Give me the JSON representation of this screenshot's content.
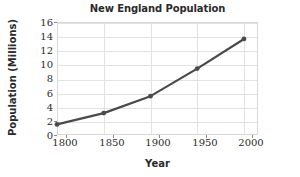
{
  "chart_data": {
    "type": "line",
    "title": "New England Population",
    "xlabel": "Year",
    "ylabel": "Population (Millions)",
    "x": [
      1790,
      1840,
      1890,
      1940,
      1990
    ],
    "values": [
      1.5,
      3.1,
      5.5,
      9.4,
      13.6
    ],
    "series": [
      {
        "name": "New England Population",
        "values": [
          1.5,
          3.1,
          5.5,
          9.4,
          13.6
        ]
      }
    ],
    "xlim": [
      1790,
      2005
    ],
    "ylim": [
      0,
      16
    ],
    "xticks": [
      1800,
      1850,
      1900,
      1950,
      2000
    ],
    "yticks": [
      0,
      2,
      4,
      6,
      8,
      10,
      12,
      14,
      16
    ],
    "xtick_labels": [
      "1800",
      "1850",
      "1900",
      "1950",
      "2000"
    ],
    "ytick_labels": [
      "0",
      "2",
      "4",
      "6",
      "8",
      "10",
      "12",
      "14",
      "16"
    ],
    "grid": true,
    "legend": "none",
    "marker": "circle",
    "line_color": "#4a4a4a",
    "marker_color": "#4a4a4a",
    "grid_color": "#e2e2e2",
    "text_color": "#2b2b2b",
    "background_color": "#ffffff"
  }
}
